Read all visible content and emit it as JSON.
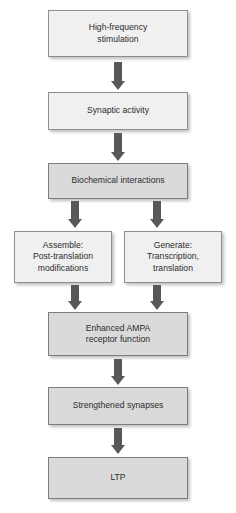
{
  "diagram": {
    "background_color": "#ffffff",
    "box_fill_light": "#f0f0f0",
    "box_fill_dark": "#dadada",
    "box_border_color": "#8f8f8f",
    "arrow_color": "#585858",
    "text_color": "#2b2b2b",
    "orientation": "top-to-bottom",
    "nodes": [
      {
        "id": "high-frequency-stimulation",
        "label": "High-frequency\nstimulation"
      },
      {
        "id": "synaptic-activity",
        "label": "Synaptic activity"
      },
      {
        "id": "biochemical-interactions",
        "label": "Biochemical interactions"
      },
      {
        "id": "assemble-post-translation-modifications",
        "label": "Assemble:\nPost-translation\nmodifications"
      },
      {
        "id": "generate-transcription-translation",
        "label": "Generate:\nTranscription,\ntranslation"
      },
      {
        "id": "enhanced-ampa-receptor-function",
        "label": "Enhanced AMPA\nreceptor function"
      },
      {
        "id": "strengthened-synapses",
        "label": "Strengthened synapses"
      },
      {
        "id": "ltp",
        "label": "LTP"
      }
    ],
    "edges": [
      {
        "from": "high-frequency-stimulation",
        "to": "synaptic-activity"
      },
      {
        "from": "synaptic-activity",
        "to": "biochemical-interactions"
      },
      {
        "from": "biochemical-interactions",
        "to": "assemble-post-translation-modifications"
      },
      {
        "from": "biochemical-interactions",
        "to": "generate-transcription-translation"
      },
      {
        "from": "assemble-post-translation-modifications",
        "to": "enhanced-ampa-receptor-function"
      },
      {
        "from": "generate-transcription-translation",
        "to": "enhanced-ampa-receptor-function"
      },
      {
        "from": "enhanced-ampa-receptor-function",
        "to": "strengthened-synapses"
      },
      {
        "from": "strengthened-synapses",
        "to": "ltp"
      }
    ]
  }
}
